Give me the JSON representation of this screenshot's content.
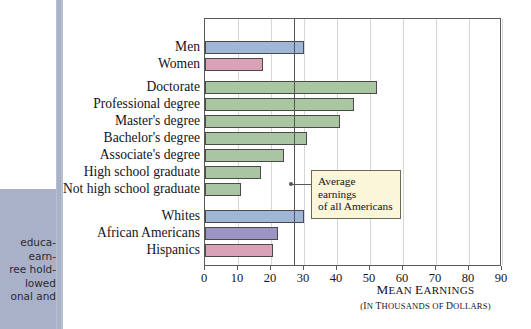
{
  "margin": {
    "caption_lines": [
      "educa-",
      "earn-",
      "ree hold-",
      "lowed",
      "onal and"
    ]
  },
  "callout": {
    "line1": "Average earnings",
    "line2": "of all Americans"
  },
  "axis_title": {
    "line1_cap": "M",
    "line1_rest": "EAN",
    "line1_cap2": " E",
    "line1_rest2": "ARNINGS",
    "line2_open": "(",
    "line2_cap": "I",
    "line2_rest": "N ",
    "line2_cap3": "T",
    "line2_rest3": "HOUSANDS OF ",
    "line2_cap4": "D",
    "line2_rest4": "OLLARS)"
  },
  "colors": {
    "blue": "#9fb6d6",
    "pink": "#d9a2b7",
    "green": "#a9c5a1",
    "purple": "#9c95c1",
    "bar_stroke": "#4a4a4a",
    "gridline": "#d6d6d6",
    "refline": "#555555",
    "callout_bg": "#fbf5d9",
    "margin_panel": "#a9b1c9"
  },
  "chart_data": {
    "type": "bar",
    "orientation": "horizontal",
    "title": "",
    "xlabel": "MEAN EARNINGS (IN THOUSANDS OF DOLLARS)",
    "ylabel": "",
    "xlim": [
      0,
      90
    ],
    "xticks": [
      0,
      10,
      20,
      30,
      40,
      50,
      60,
      70,
      80,
      90
    ],
    "grid": "vertical",
    "legend": "none",
    "reference_line": {
      "value": 27,
      "label": "Average earnings of all Americans"
    },
    "groups": [
      {
        "name": "gender",
        "categories": [
          "Men",
          "Women"
        ],
        "values": [
          30,
          17.5
        ],
        "colors": [
          "#9fb6d6",
          "#d9a2b7"
        ]
      },
      {
        "name": "education",
        "categories": [
          "Doctorate",
          "Professional degree",
          "Master's degree",
          "Bachelor's degree",
          "Associate's degree",
          "High school graduate",
          "Not high school graduate"
        ],
        "values": [
          52,
          45,
          41,
          31,
          24,
          17,
          11
        ],
        "colors": [
          "#a9c5a1",
          "#a9c5a1",
          "#a9c5a1",
          "#a9c5a1",
          "#a9c5a1",
          "#a9c5a1",
          "#a9c5a1"
        ]
      },
      {
        "name": "race",
        "categories": [
          "Whites",
          "African Americans",
          "Hispanics"
        ],
        "values": [
          30,
          22,
          20.5
        ],
        "colors": [
          "#9fb6d6",
          "#9c95c1",
          "#d9a2b7"
        ]
      }
    ]
  }
}
